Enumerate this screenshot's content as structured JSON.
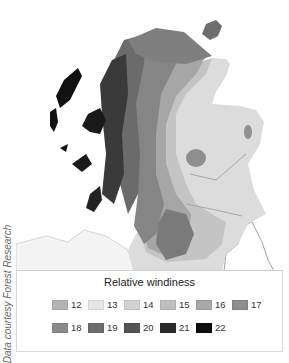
{
  "map": {
    "region": "Scotland",
    "subject": "Relative windiness"
  },
  "legend": {
    "title": "Relative windiness",
    "rows": [
      [
        {
          "label": "12",
          "color": "#b4b4b4"
        },
        {
          "label": "13",
          "color": "#e6e6e6"
        },
        {
          "label": "14",
          "color": "#d2d2d2"
        },
        {
          "label": "15",
          "color": "#bfbfbf"
        },
        {
          "label": "16",
          "color": "#a8a8a8"
        },
        {
          "label": "17",
          "color": "#8f8f8f"
        }
      ],
      [
        {
          "label": "18",
          "color": "#8a8a8a"
        },
        {
          "label": "19",
          "color": "#6e6e6e"
        },
        {
          "label": "20",
          "color": "#555555"
        },
        {
          "label": "21",
          "color": "#2a2a2a"
        },
        {
          "label": "22",
          "color": "#0d0d0d"
        }
      ]
    ]
  },
  "credit": "Data courtesy Forest Research"
}
